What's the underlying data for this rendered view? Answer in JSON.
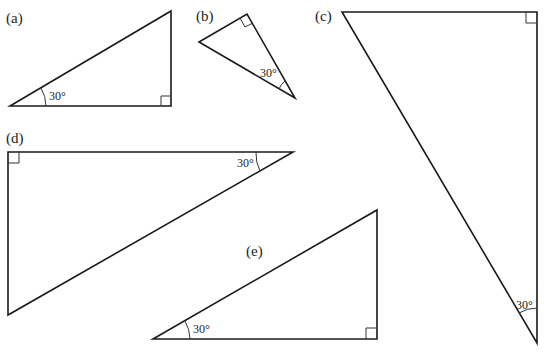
{
  "figure": {
    "triangles": [
      {
        "id": "a",
        "label": "(a)",
        "angle_label": "30°",
        "right_angle": true
      },
      {
        "id": "b",
        "label": "(b)",
        "angle_label": "30°",
        "right_angle": true
      },
      {
        "id": "c",
        "label": "(c)",
        "angle_label": "30°",
        "right_angle": true
      },
      {
        "id": "d",
        "label": "(d)",
        "angle_label": "30°",
        "right_angle": true
      },
      {
        "id": "e",
        "label": "(e)",
        "angle_label": "30°",
        "right_angle": true
      }
    ]
  }
}
